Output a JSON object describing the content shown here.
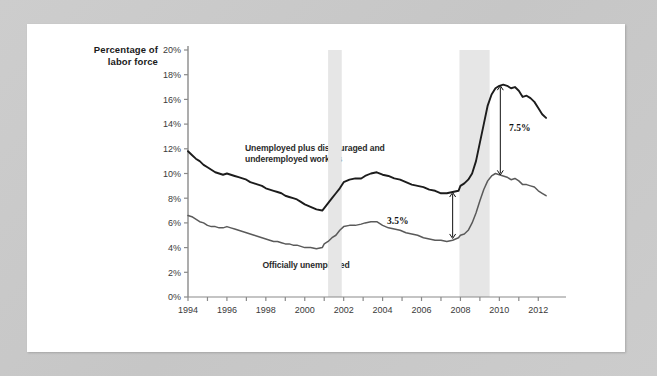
{
  "page": {
    "background_color": "#c9c9c9",
    "paper_color": "#ffffff"
  },
  "chart_data": {
    "type": "line",
    "title": "",
    "xlabel": "",
    "ylabel": "Percentage of labor force",
    "ylabel_line1": "Percentage of",
    "ylabel_line2": "labor force",
    "xlim": [
      1994,
      2012.5
    ],
    "ylim": [
      0,
      20
    ],
    "y_tick_step": 2,
    "grid": false,
    "legend_position": "inline-annotations",
    "y_ticks": [
      "0%",
      "2%",
      "4%",
      "6%",
      "8%",
      "10%",
      "12%",
      "14%",
      "16%",
      "18%",
      "20%"
    ],
    "y_tick_values": [
      0,
      2,
      4,
      6,
      8,
      10,
      12,
      14,
      16,
      18,
      20
    ],
    "x_ticks": [
      "1994",
      "1996",
      "1998",
      "2000",
      "2002",
      "2004",
      "2006",
      "2008",
      "2010",
      "2012"
    ],
    "x_tick_values": [
      1994,
      1996,
      1998,
      2000,
      2002,
      2004,
      2006,
      2008,
      2010,
      2012
    ],
    "x_minor_tick_values": [
      1995,
      1997,
      1999,
      2001,
      2003,
      2005,
      2007,
      2009,
      2011
    ],
    "series": [
      {
        "name": "Unemployed plus discouraged and underemployed workers",
        "label": "Unemployed plus discouraged and underemployed workers",
        "color": "#1c1c1c",
        "width": 1.9,
        "x": [
          1994.0,
          1994.2,
          1994.4,
          1994.6,
          1994.8,
          1995.0,
          1995.2,
          1995.4,
          1995.6,
          1995.8,
          1996.0,
          1996.2,
          1996.4,
          1996.6,
          1996.8,
          1997.0,
          1997.2,
          1997.4,
          1997.6,
          1997.8,
          1998.0,
          1998.2,
          1998.4,
          1998.6,
          1998.8,
          1999.0,
          1999.2,
          1999.4,
          1999.6,
          1999.8,
          2000.0,
          2000.3,
          2000.6,
          2000.9,
          2001.0,
          2001.2,
          2001.4,
          2001.6,
          2001.8,
          2002.0,
          2002.3,
          2002.6,
          2002.9,
          2003.1,
          2003.4,
          2003.7,
          2004.0,
          2004.3,
          2004.6,
          2004.9,
          2005.2,
          2005.5,
          2005.8,
          2006.1,
          2006.4,
          2006.7,
          2007.0,
          2007.3,
          2007.6,
          2007.9,
          2008.0,
          2008.2,
          2008.4,
          2008.6,
          2008.8,
          2009.0,
          2009.2,
          2009.4,
          2009.6,
          2009.8,
          2010.0,
          2010.2,
          2010.4,
          2010.6,
          2010.8,
          2011.0,
          2011.2,
          2011.4,
          2011.6,
          2011.8,
          2012.0,
          2012.2,
          2012.4
        ],
        "y": [
          11.8,
          11.5,
          11.2,
          11.0,
          10.7,
          10.5,
          10.3,
          10.1,
          10.0,
          9.9,
          10.0,
          9.9,
          9.8,
          9.7,
          9.6,
          9.5,
          9.3,
          9.2,
          9.1,
          9.0,
          8.8,
          8.7,
          8.6,
          8.5,
          8.4,
          8.2,
          8.1,
          8.0,
          7.9,
          7.7,
          7.5,
          7.3,
          7.1,
          7.0,
          7.2,
          7.6,
          8.0,
          8.4,
          8.8,
          9.3,
          9.5,
          9.6,
          9.6,
          9.8,
          10.0,
          10.1,
          9.9,
          9.8,
          9.6,
          9.5,
          9.3,
          9.1,
          9.0,
          8.9,
          8.7,
          8.6,
          8.4,
          8.4,
          8.5,
          8.6,
          9.0,
          9.2,
          9.5,
          10.0,
          11.0,
          12.5,
          14.0,
          15.5,
          16.4,
          16.9,
          17.1,
          17.2,
          17.1,
          16.9,
          17.0,
          16.7,
          16.2,
          16.3,
          16.1,
          15.8,
          15.3,
          14.8,
          14.5
        ],
        "end_value": 14.5,
        "peak_value": 17.2,
        "start_value": 11.8
      },
      {
        "name": "Officially unemployed",
        "label": "Officially unemployed",
        "color": "#5a5a5a",
        "width": 1.5,
        "x": [
          1994.0,
          1994.2,
          1994.4,
          1994.6,
          1994.8,
          1995.0,
          1995.2,
          1995.4,
          1995.6,
          1995.8,
          1996.0,
          1996.2,
          1996.4,
          1996.6,
          1996.8,
          1997.0,
          1997.2,
          1997.4,
          1997.6,
          1997.8,
          1998.0,
          1998.2,
          1998.4,
          1998.6,
          1998.8,
          1999.0,
          1999.2,
          1999.4,
          1999.6,
          1999.8,
          2000.0,
          2000.3,
          2000.6,
          2000.9,
          2001.0,
          2001.2,
          2001.4,
          2001.6,
          2001.8,
          2002.0,
          2002.3,
          2002.6,
          2002.9,
          2003.1,
          2003.4,
          2003.7,
          2004.0,
          2004.3,
          2004.6,
          2004.9,
          2005.2,
          2005.5,
          2005.8,
          2006.1,
          2006.4,
          2006.7,
          2007.0,
          2007.3,
          2007.6,
          2007.9,
          2008.0,
          2008.2,
          2008.4,
          2008.6,
          2008.8,
          2009.0,
          2009.2,
          2009.4,
          2009.6,
          2009.8,
          2010.0,
          2010.2,
          2010.4,
          2010.6,
          2010.8,
          2011.0,
          2011.2,
          2011.4,
          2011.6,
          2011.8,
          2012.0,
          2012.2,
          2012.4
        ],
        "y": [
          6.6,
          6.5,
          6.3,
          6.1,
          6.0,
          5.8,
          5.7,
          5.7,
          5.6,
          5.6,
          5.7,
          5.6,
          5.5,
          5.4,
          5.3,
          5.2,
          5.1,
          5.0,
          4.9,
          4.8,
          4.7,
          4.6,
          4.5,
          4.5,
          4.4,
          4.3,
          4.3,
          4.2,
          4.2,
          4.1,
          4.0,
          4.0,
          3.9,
          4.0,
          4.3,
          4.5,
          4.8,
          5.0,
          5.4,
          5.7,
          5.8,
          5.8,
          5.9,
          6.0,
          6.1,
          6.1,
          5.8,
          5.6,
          5.5,
          5.4,
          5.2,
          5.1,
          5.0,
          4.8,
          4.7,
          4.6,
          4.6,
          4.5,
          4.6,
          4.8,
          5.0,
          5.1,
          5.4,
          6.0,
          6.8,
          7.8,
          8.7,
          9.4,
          9.8,
          10.0,
          9.9,
          9.8,
          9.7,
          9.5,
          9.6,
          9.4,
          9.1,
          9.1,
          9.0,
          8.9,
          8.6,
          8.4,
          8.2
        ],
        "end_value": 8.2,
        "peak_value": 10.0,
        "start_value": 6.6
      }
    ],
    "recession_bands": [
      {
        "name": "recession-2001",
        "start": 2001.2,
        "end": 2001.9,
        "color": "#e6e6e6"
      },
      {
        "name": "recession-2008",
        "start": 2007.95,
        "end": 2009.5,
        "color": "#e6e6e6"
      }
    ],
    "annotations": [
      {
        "name": "gap-2007",
        "label": "3.5%",
        "x": 2007.6,
        "y_top": 8.5,
        "y_bottom": 4.7,
        "value": 3.5,
        "arrow": "double"
      },
      {
        "name": "gap-2010",
        "label": "7.5%",
        "x": 2010.05,
        "y_top": 17.15,
        "y_bottom": 9.85,
        "value": 7.5,
        "arrow": "double"
      }
    ]
  }
}
